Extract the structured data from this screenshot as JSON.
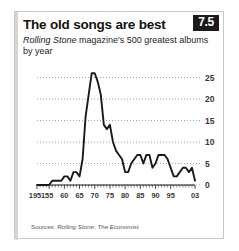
{
  "card": {
    "title": "The old songs are best",
    "rank_badge": "7.5",
    "subtitle_italic": "Rolling Stone",
    "subtitle_rest": " magazine's 500 greatest albums by year",
    "source_prefix": "Sources: ",
    "source_italic_1": "Rolling Stone",
    "source_sep": "; ",
    "source_italic_2": "The Economist",
    "accent_color": "#d6d6d0",
    "badge_bg": "#1a1a1a",
    "line_color": "#1a1a1a",
    "grid_color": "#8e8b86"
  },
  "chart_data": {
    "type": "line",
    "title": "The old songs are best",
    "subtitle": "Rolling Stone magazine's 500 greatest albums by year",
    "xlabel": "",
    "ylabel": "",
    "xlim": [
      1951,
      2003
    ],
    "ylim": [
      0,
      27
    ],
    "yticks": [
      0,
      5,
      10,
      15,
      20,
      25
    ],
    "xticks": [
      1951,
      1955,
      1960,
      1965,
      1970,
      1975,
      1980,
      1985,
      1990,
      1995,
      2003
    ],
    "xticklabels": [
      "1951",
      "55",
      "60",
      "65",
      "70",
      "75",
      "80",
      "85",
      "90",
      "95",
      "03"
    ],
    "grid": "horizontal-dotted",
    "legend": "none",
    "x": [
      1951,
      1952,
      1953,
      1954,
      1955,
      1956,
      1957,
      1958,
      1959,
      1960,
      1961,
      1962,
      1963,
      1964,
      1965,
      1966,
      1967,
      1968,
      1969,
      1970,
      1971,
      1972,
      1973,
      1974,
      1975,
      1976,
      1977,
      1978,
      1979,
      1980,
      1981,
      1982,
      1983,
      1984,
      1985,
      1986,
      1987,
      1988,
      1989,
      1990,
      1991,
      1992,
      1993,
      1994,
      1995,
      1996,
      1997,
      1998,
      1999,
      2000,
      2001,
      2002,
      2003
    ],
    "values": [
      0,
      0,
      0,
      0,
      0,
      1,
      1,
      1,
      1,
      2,
      2,
      1,
      3,
      3,
      2,
      6,
      16,
      21,
      26,
      26,
      24,
      21,
      14,
      13,
      14,
      10,
      8,
      7,
      6,
      3,
      3,
      5,
      6,
      7,
      7,
      5,
      7,
      7,
      4,
      5,
      7,
      7,
      7,
      6,
      4,
      2,
      2,
      3,
      4,
      4,
      3,
      4,
      1
    ],
    "series_name": "Albums per year"
  }
}
